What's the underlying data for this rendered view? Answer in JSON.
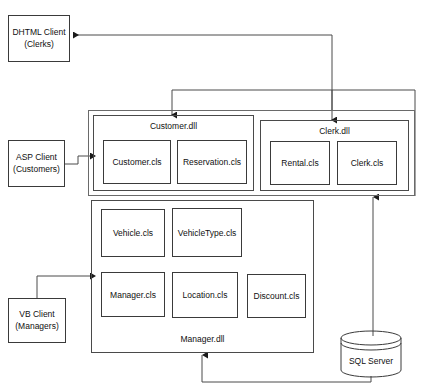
{
  "diagram": {
    "type": "component-diagram",
    "stroke_color": "#3a3a3a",
    "background_color": "#ffffff"
  },
  "clients": [
    {
      "id": "dhtml-client",
      "line1": "DHTML Client",
      "line2": "(Clerks)"
    },
    {
      "id": "asp-client",
      "line1": "ASP Client",
      "line2": "(Customers)"
    },
    {
      "id": "vb-client",
      "line1": "VB Client",
      "line2": "(Managers)"
    }
  ],
  "components": [
    {
      "id": "customer-dll",
      "label": "Customer.dll",
      "classes": [
        {
          "id": "customer-cls",
          "label": "Customer.cls"
        },
        {
          "id": "reservation-cls",
          "label": "Reservation.cls"
        }
      ]
    },
    {
      "id": "clerk-dll",
      "label": "Clerk.dll",
      "classes": [
        {
          "id": "rental-cls",
          "label": "Rental.cls"
        },
        {
          "id": "clerk-cls",
          "label": "Clerk.cls"
        }
      ]
    },
    {
      "id": "manager-dll",
      "label": "Manager.dll",
      "classes": [
        {
          "id": "vehicle-cls",
          "label": "Vehicle.cls"
        },
        {
          "id": "vehicletype-cls",
          "label": "VehicleType.cls"
        },
        {
          "id": "manager-cls",
          "label": "Manager.cls"
        },
        {
          "id": "location-cls",
          "label": "Location.cls"
        },
        {
          "id": "discount-cls",
          "label": "Discount.cls"
        }
      ]
    }
  ],
  "database": {
    "id": "sql-server",
    "label": "SQL Server"
  },
  "connectors": [
    {
      "id": "clerkdll-to-dhtml-client",
      "from": "Clerk.dll",
      "to": "DHTML Client",
      "direction": "left"
    },
    {
      "id": "bus-to-customer-dll",
      "from": "component bus",
      "to": "Customer.dll",
      "direction": "down"
    },
    {
      "id": "bus-to-clerk-dll",
      "from": "component bus",
      "to": "Clerk.dll",
      "direction": "down"
    },
    {
      "id": "asp-client-to-customer-dll",
      "from": "ASP Client",
      "to": "Customer.dll",
      "direction": "right"
    },
    {
      "id": "vb-client-to-manager-dll",
      "from": "VB Client",
      "to": "Manager.dll",
      "direction": "right"
    },
    {
      "id": "sql-server-to-component-group",
      "from": "SQL Server",
      "to": "component group",
      "direction": "up"
    },
    {
      "id": "sql-server-to-manager-dll",
      "from": "SQL Server",
      "to": "Manager.dll",
      "direction": "up"
    }
  ]
}
